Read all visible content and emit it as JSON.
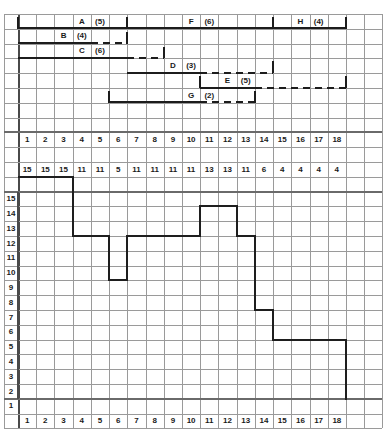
{
  "meta": {
    "grid": {
      "col_width": 18.2,
      "row_height": 14.8,
      "origin_x": 18,
      "origin_y": 14,
      "cols": 20,
      "rows": 28
    },
    "colors": {
      "grid_line": "#9a9a9a",
      "grid_strong": "#6d6d6d",
      "ink": "#1c1c1c",
      "background": "#ffffff"
    }
  },
  "gantt": {
    "tasks": [
      {
        "id": "A",
        "label": "A",
        "duration_label": "(5)",
        "duration": 5,
        "label_col": 4,
        "dur_col": 5,
        "solid_start": 1,
        "solid_end": 7,
        "dash_start": null,
        "dash_end": null,
        "row": 1,
        "start_tick": true,
        "end_tick": true
      },
      {
        "id": "B",
        "label": "B",
        "duration_label": "(4)",
        "duration": 4,
        "label_col": 3,
        "dur_col": 4,
        "solid_start": 1,
        "solid_end": 5,
        "dash_start": 5,
        "dash_end": 7,
        "row": 2,
        "start_tick": false,
        "end_tick": true
      },
      {
        "id": "C",
        "label": "C",
        "duration_label": "(6)",
        "duration": 6,
        "label_col": 4,
        "dur_col": 5,
        "solid_start": 1,
        "solid_end": 7,
        "dash_start": 7,
        "dash_end": 9,
        "row": 3,
        "start_tick": false,
        "end_tick": true
      },
      {
        "id": "D",
        "label": "D",
        "duration_label": "(3)",
        "duration": 3,
        "label_col": 9,
        "dur_col": 10,
        "solid_start": 7,
        "solid_end": 11,
        "dash_start": 11,
        "dash_end": 15,
        "row": 4,
        "start_tick": false,
        "end_tick": true
      },
      {
        "id": "E",
        "label": "E",
        "duration_label": "(5)",
        "duration": 5,
        "label_col": 12,
        "dur_col": 13,
        "solid_start": 11,
        "solid_end": 14,
        "dash_start": 14,
        "dash_end": 19,
        "row": 5,
        "start_tick": true,
        "end_tick": true
      },
      {
        "id": "F",
        "label": "F",
        "duration_label": "(6)",
        "duration": 6,
        "label_col": 10,
        "dur_col": 11,
        "solid_start": 7,
        "solid_end": 15,
        "dash_start": null,
        "dash_end": null,
        "row": 1,
        "start_tick": true,
        "end_tick": true
      },
      {
        "id": "G",
        "label": "G",
        "duration_label": "(2)",
        "duration": 2,
        "label_col": 10,
        "dur_col": 11,
        "solid_start": 6,
        "solid_end": 11,
        "dash_start": 11,
        "dash_end": 14,
        "row": 6,
        "start_tick": true,
        "end_tick": true
      },
      {
        "id": "H",
        "label": "H",
        "duration_label": "(4)",
        "duration": 4,
        "label_col": 16,
        "dur_col": 17,
        "solid_start": 15,
        "solid_end": 19,
        "dash_start": null,
        "dash_end": null,
        "row": 1,
        "start_tick": true,
        "end_tick": true
      }
    ]
  },
  "time_row": {
    "header_label": "",
    "values": [
      "1",
      "2",
      "3",
      "4",
      "5",
      "6",
      "7",
      "8",
      "9",
      "10",
      "11",
      "12",
      "13",
      "14",
      "15",
      "16",
      "17",
      "18"
    ]
  },
  "resource_row": {
    "header_label": "",
    "values": [
      "15",
      "15",
      "15",
      "11",
      "11",
      "5",
      "11",
      "11",
      "11",
      "11",
      "13",
      "13",
      "11",
      "6",
      "4",
      "4",
      "4",
      "4"
    ]
  },
  "axis_bottom": {
    "values": [
      "1",
      "2",
      "3",
      "4",
      "5",
      "6",
      "7",
      "8",
      "9",
      "10",
      "11",
      "12",
      "13",
      "14",
      "15",
      "16",
      "17",
      "18"
    ]
  },
  "y_axis": {
    "values": [
      "15",
      "14",
      "13",
      "12",
      "11",
      "10",
      "9",
      "8",
      "7",
      "6",
      "5",
      "4",
      "3",
      "2",
      "1"
    ]
  },
  "chart_data": {
    "type": "line",
    "xlabel": "",
    "ylabel": "",
    "x": [
      1,
      2,
      3,
      4,
      5,
      6,
      7,
      8,
      9,
      10,
      11,
      12,
      13,
      14,
      15,
      16,
      17,
      18
    ],
    "categories": [
      "1",
      "2",
      "3",
      "4",
      "5",
      "6",
      "7",
      "8",
      "9",
      "10",
      "11",
      "12",
      "13",
      "14",
      "15",
      "16",
      "17",
      "18"
    ],
    "values": [
      15,
      15,
      15,
      11,
      11,
      8,
      11,
      11,
      11,
      11,
      13,
      13,
      11,
      6,
      4,
      4,
      4,
      4
    ],
    "series": [
      {
        "name": "resource level (step profile)",
        "values": [
          15,
          15,
          15,
          11,
          11,
          8,
          11,
          11,
          11,
          11,
          13,
          13,
          11,
          6,
          4,
          4,
          4,
          4
        ]
      },
      {
        "name": "resource table row",
        "values": [
          15,
          15,
          15,
          11,
          11,
          5,
          11,
          11,
          11,
          11,
          13,
          13,
          11,
          6,
          4,
          4,
          4,
          4
        ]
      }
    ],
    "ylim": [
      0,
      15
    ],
    "xlim": [
      1,
      18
    ],
    "grid": true,
    "legend": "none",
    "step": "post"
  }
}
